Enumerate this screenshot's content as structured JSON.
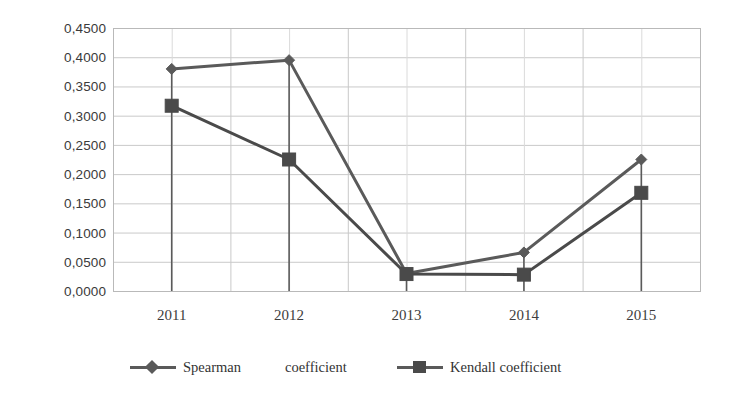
{
  "chart_data": {
    "type": "line",
    "title": "",
    "xlabel": "",
    "ylabel": "",
    "categories": [
      "2011",
      "2012",
      "2013",
      "2014",
      "2015"
    ],
    "series": [
      {
        "name": "Spearman coefficient",
        "marker": "diamond",
        "color": "#5a5a5a",
        "values": [
          0.38,
          0.395,
          0.03,
          0.066,
          0.225
        ]
      },
      {
        "name": "Kendall coefficient",
        "marker": "square",
        "color": "#4a4a4a",
        "values": [
          0.317,
          0.225,
          0.029,
          0.028,
          0.168
        ]
      }
    ],
    "ylim": [
      0.0,
      0.45
    ],
    "ytick_labels": [
      "0,4500",
      "0,4000",
      "0,3500",
      "0,3000",
      "0,2500",
      "0,2000",
      "0,1500",
      "0,1000",
      "0,0500",
      "0,0000"
    ],
    "ytick_values": [
      0.45,
      0.4,
      0.35,
      0.3,
      0.25,
      0.2,
      0.15,
      0.1,
      0.05,
      0.0
    ],
    "grid": {
      "horizontal": true,
      "vertical": true,
      "color": "#c9c9c9"
    },
    "drop_lines": true,
    "legend": {
      "position": "bottom",
      "entries": [
        {
          "label_part1": "Spearman",
          "label_part2": "coefficient",
          "marker": "diamond"
        },
        {
          "label_part1": "Kendall coefficient",
          "label_part2": "",
          "marker": "square"
        }
      ]
    },
    "plot_area": {
      "left": 113,
      "top": 28,
      "right": 700,
      "bottom": 291
    }
  },
  "legend": {
    "spearman_part1": "Spearman",
    "spearman_part2": "coefficient",
    "kendall_label": "Kendall coefficient"
  }
}
